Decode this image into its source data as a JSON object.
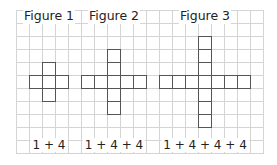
{
  "grid": {
    "columns": 19,
    "rows": 11,
    "cell_size_px": 13,
    "line_color": "#d4d4d4"
  },
  "square_border_color": "#555555",
  "figures": [
    {
      "title": "Figure 1",
      "expression": "1 + 4",
      "center_col": 2,
      "center_row": 5,
      "arm_length": 1,
      "square_count": 5
    },
    {
      "title": "Figure 2",
      "expression": "1 + 4 + 4",
      "center_col": 7,
      "center_row": 5,
      "arm_length": 2,
      "square_count": 9
    },
    {
      "title": "Figure 3",
      "expression": "1 + 4 + 4 + 4",
      "center_col": 14,
      "center_row": 5,
      "arm_length": 3,
      "square_count": 13
    }
  ]
}
